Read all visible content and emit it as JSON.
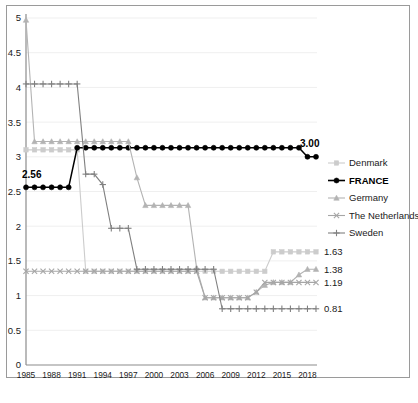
{
  "chart_data": {
    "type": "line",
    "title": "",
    "xlabel": "",
    "ylabel": "",
    "xlim": [
      1985,
      2019
    ],
    "ylim": [
      0,
      5
    ],
    "yticks": [
      "0",
      "0.5",
      "1",
      "1.5",
      "2",
      "2.5",
      "3",
      "3.5",
      "4",
      "4.5",
      "5"
    ],
    "xticks": [
      "1985",
      "1988",
      "1991",
      "1994",
      "1997",
      "2000",
      "2003",
      "2006",
      "2009",
      "2012",
      "2015",
      "2018"
    ],
    "grid": true,
    "legend_position": "right",
    "x": [
      1985,
      1986,
      1987,
      1988,
      1989,
      1990,
      1991,
      1992,
      1993,
      1994,
      1995,
      1996,
      1997,
      1998,
      1999,
      2000,
      2001,
      2002,
      2003,
      2004,
      2005,
      2006,
      2007,
      2008,
      2009,
      2010,
      2011,
      2012,
      2013,
      2014,
      2015,
      2016,
      2017,
      2018,
      2019
    ],
    "series": [
      {
        "name": "Denmark",
        "color": "#cccccc",
        "marker": "square",
        "end_label": "1.63",
        "values": [
          3.1,
          3.1,
          3.1,
          3.1,
          3.1,
          3.1,
          3.1,
          1.35,
          1.35,
          1.35,
          1.35,
          1.35,
          1.35,
          1.35,
          1.35,
          1.35,
          1.35,
          1.35,
          1.35,
          1.35,
          1.35,
          1.35,
          1.35,
          1.35,
          1.35,
          1.35,
          1.35,
          1.35,
          1.35,
          1.63,
          1.63,
          1.63,
          1.63,
          1.63,
          1.63
        ]
      },
      {
        "name": "FRANCE",
        "color": "#000000",
        "marker": "circle",
        "end_label": "3.00",
        "start_label": "2.56",
        "values": [
          2.56,
          2.56,
          2.56,
          2.56,
          2.56,
          2.56,
          3.13,
          3.13,
          3.13,
          3.13,
          3.13,
          3.13,
          3.13,
          3.13,
          3.13,
          3.13,
          3.13,
          3.13,
          3.13,
          3.13,
          3.13,
          3.13,
          3.13,
          3.13,
          3.13,
          3.13,
          3.13,
          3.13,
          3.13,
          3.13,
          3.13,
          3.13,
          3.13,
          3.0,
          3.0
        ]
      },
      {
        "name": "Germany",
        "color": "#b3b3b3",
        "marker": "triangle",
        "end_label": "1.38",
        "values": [
          4.97,
          3.22,
          3.22,
          3.22,
          3.22,
          3.22,
          3.22,
          3.22,
          3.22,
          3.22,
          3.22,
          3.22,
          3.22,
          2.7,
          2.3,
          2.3,
          2.3,
          2.3,
          2.3,
          2.3,
          1.4,
          0.97,
          0.97,
          0.97,
          0.97,
          0.97,
          0.97,
          1.05,
          1.15,
          1.19,
          1.19,
          1.19,
          1.3,
          1.38,
          1.38
        ]
      },
      {
        "name": "The Netherlands",
        "color": "#a6a6a6",
        "marker": "x",
        "end_label": "1.19",
        "values": [
          1.35,
          1.35,
          1.35,
          1.35,
          1.35,
          1.35,
          1.35,
          1.35,
          1.35,
          1.35,
          1.35,
          1.35,
          1.35,
          1.35,
          1.35,
          1.35,
          1.35,
          1.35,
          1.35,
          1.35,
          1.35,
          0.97,
          0.97,
          0.97,
          0.97,
          0.97,
          0.97,
          1.05,
          1.19,
          1.19,
          1.19,
          1.19,
          1.19,
          1.19,
          1.19
        ]
      },
      {
        "name": "Sweden",
        "color": "#808080",
        "marker": "plus",
        "end_label": "0.81",
        "values": [
          4.05,
          4.05,
          4.05,
          4.05,
          4.05,
          4.05,
          4.05,
          2.75,
          2.75,
          2.6,
          1.97,
          1.97,
          1.97,
          1.38,
          1.38,
          1.38,
          1.38,
          1.38,
          1.38,
          1.38,
          1.38,
          1.38,
          1.38,
          0.81,
          0.81,
          0.81,
          0.81,
          0.81,
          0.81,
          0.81,
          0.81,
          0.81,
          0.81,
          0.81,
          0.81
        ]
      }
    ],
    "annotations": [
      {
        "text": "2.56",
        "series": "FRANCE",
        "position": "start"
      },
      {
        "text": "3.00",
        "series": "FRANCE",
        "position": "end"
      },
      {
        "text": "1.63",
        "series": "Denmark",
        "position": "end"
      },
      {
        "text": "1.38",
        "series": "Germany",
        "position": "end"
      },
      {
        "text": "1.19",
        "series": "The Netherlands",
        "position": "end"
      },
      {
        "text": "0.81",
        "series": "Sweden",
        "position": "end"
      }
    ]
  },
  "legend": {
    "items": [
      {
        "label": "Denmark",
        "marker": "square",
        "color": "#cccccc",
        "bold": false
      },
      {
        "label": "FRANCE",
        "marker": "circle",
        "color": "#000000",
        "bold": true
      },
      {
        "label": "Germany",
        "marker": "triangle",
        "color": "#b3b3b3",
        "bold": false
      },
      {
        "label": "The Netherlands",
        "marker": "x",
        "color": "#a6a6a6",
        "bold": false
      },
      {
        "label": "Sweden",
        "marker": "plus",
        "color": "#808080",
        "bold": false
      }
    ]
  }
}
